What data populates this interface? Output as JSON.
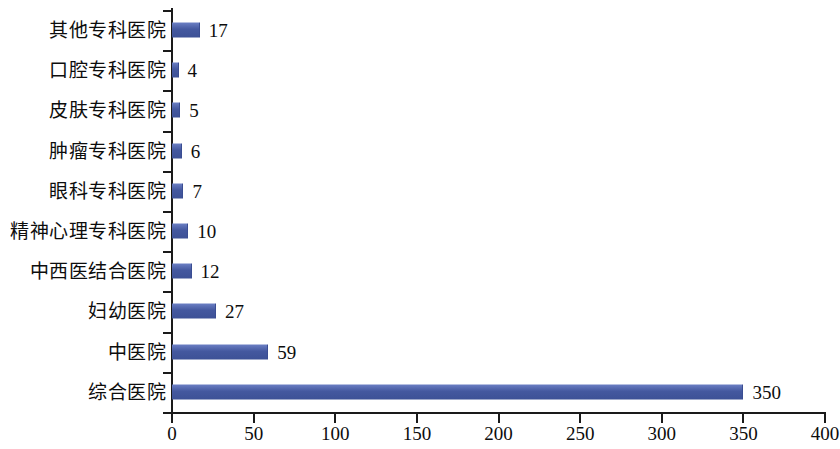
{
  "chart_data": {
    "type": "bar",
    "orientation": "horizontal",
    "title": "",
    "xlabel": "",
    "ylabel": "",
    "categories": [
      "其他专科医院",
      "口腔专科医院",
      "皮肤专科医院",
      "肿瘤专科医院",
      "眼科专科医院",
      "精神心理专科医院",
      "中西医结合医院",
      "妇幼医院",
      "中医院",
      "综合医院"
    ],
    "values": [
      17,
      4,
      5,
      6,
      7,
      10,
      12,
      27,
      59,
      350
    ],
    "data_labels": [
      "17",
      "4",
      "5",
      "6",
      "7",
      "10",
      "12",
      "27",
      "59",
      "350"
    ],
    "xlim": [
      0,
      400
    ],
    "xticks": [
      0,
      50,
      100,
      150,
      200,
      250,
      300,
      350,
      400
    ],
    "xtick_labels": [
      "0",
      "50",
      "100",
      "150",
      "200",
      "250",
      "300",
      "350",
      "400"
    ],
    "grid": false,
    "legend": false,
    "bar_color": "#44589f",
    "axis_color": "#1a1a1a",
    "background": "#ffffff"
  }
}
